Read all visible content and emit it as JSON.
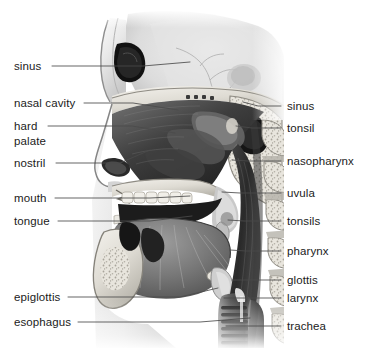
{
  "figure": {
    "style": "grayscale medical illustration",
    "background_color": "#ffffff",
    "label_color": "#1b1b1b",
    "leader_color": "#4a4a4a",
    "art_bounds": {
      "x": 85,
      "y": 12,
      "width": 198,
      "height": 336
    }
  },
  "labels_left": [
    {
      "id": "sinus",
      "text": "sinus",
      "x": 14,
      "y": 60,
      "line": [
        [
          52,
          66
        ],
        [
          143,
          66
        ],
        [
          190,
          62
        ]
      ]
    },
    {
      "id": "nasal-cavity",
      "text": "nasal cavity",
      "x": 14,
      "y": 97,
      "line": [
        [
          84,
          103
        ],
        [
          133,
          103
        ],
        [
          178,
          110
        ]
      ]
    },
    {
      "id": "hard-palate-1",
      "text": "hard",
      "x": 14,
      "y": 120,
      "line": [
        [
          48,
          126
        ],
        [
          132,
          126
        ],
        [
          175,
          133
        ]
      ]
    },
    {
      "id": "hard-palate-2",
      "text": "palate",
      "x": 14,
      "y": 135,
      "line": null
    },
    {
      "id": "nostril",
      "text": "nostril",
      "x": 14,
      "y": 157,
      "line": [
        [
          56,
          163
        ],
        [
          120,
          163
        ],
        [
          150,
          150
        ]
      ]
    },
    {
      "id": "mouth",
      "text": "mouth",
      "x": 14,
      "y": 192,
      "line": [
        [
          55,
          198
        ],
        [
          150,
          198
        ],
        [
          190,
          196
        ]
      ]
    },
    {
      "id": "tongue",
      "text": "tongue",
      "x": 14,
      "y": 215,
      "line": [
        [
          58,
          221
        ],
        [
          150,
          221
        ],
        [
          192,
          216
        ]
      ]
    },
    {
      "id": "epiglottis",
      "text": "epiglottis",
      "x": 14,
      "y": 291,
      "line": [
        [
          68,
          297
        ],
        [
          180,
          297
        ],
        [
          218,
          288
        ]
      ]
    },
    {
      "id": "esophagus",
      "text": "esophagus",
      "x": 14,
      "y": 316,
      "line": [
        [
          78,
          322
        ],
        [
          200,
          322
        ],
        [
          250,
          318
        ]
      ]
    }
  ],
  "labels_right": [
    {
      "id": "sinus-right",
      "text": "sinus",
      "x": 283,
      "y": 100,
      "line": [
        [
          281,
          106
        ],
        [
          258,
          106
        ],
        [
          243,
          102
        ]
      ]
    },
    {
      "id": "tonsil",
      "text": "tonsil",
      "x": 283,
      "y": 122,
      "line": [
        [
          281,
          128
        ],
        [
          252,
          128
        ],
        [
          236,
          126
        ]
      ]
    },
    {
      "id": "nasopharynx",
      "text": "nasopharynx",
      "x": 283,
      "y": 155,
      "line": [
        [
          281,
          161
        ],
        [
          248,
          161
        ],
        [
          232,
          160
        ]
      ]
    },
    {
      "id": "uvula",
      "text": "uvula",
      "x": 283,
      "y": 187,
      "line": [
        [
          281,
          193
        ],
        [
          240,
          193
        ],
        [
          222,
          192
        ]
      ]
    },
    {
      "id": "tonsils",
      "text": "tonsils",
      "x": 283,
      "y": 215,
      "line": [
        [
          281,
          221
        ],
        [
          244,
          221
        ],
        [
          228,
          220
        ]
      ]
    },
    {
      "id": "pharynx",
      "text": "pharynx",
      "x": 283,
      "y": 245,
      "line": [
        [
          281,
          251
        ],
        [
          246,
          251
        ],
        [
          230,
          250
        ]
      ]
    },
    {
      "id": "glottis",
      "text": "glottis",
      "x": 283,
      "y": 274,
      "line": [
        [
          281,
          280
        ],
        [
          248,
          280
        ],
        [
          232,
          280
        ]
      ]
    },
    {
      "id": "larynx",
      "text": "larynx",
      "x": 283,
      "y": 292,
      "line": [
        [
          281,
          298
        ],
        [
          240,
          298
        ],
        [
          224,
          298
        ]
      ]
    },
    {
      "id": "trachea",
      "text": "trachea",
      "x": 283,
      "y": 320,
      "line": [
        [
          281,
          326
        ],
        [
          244,
          326
        ],
        [
          226,
          326
        ]
      ]
    }
  ],
  "anatomy_structures": [
    "frontal sinus",
    "nasal cavity",
    "nasal turbinates",
    "hard palate",
    "soft palate",
    "nostril",
    "oral cavity",
    "teeth",
    "tongue",
    "uvula",
    "palatine tonsil",
    "pharyngeal tonsil",
    "nasopharynx",
    "oropharynx",
    "epiglottis",
    "glottis",
    "larynx",
    "trachea",
    "esophagus",
    "cervical vertebrae",
    "hyoid bone",
    "brain stem"
  ]
}
